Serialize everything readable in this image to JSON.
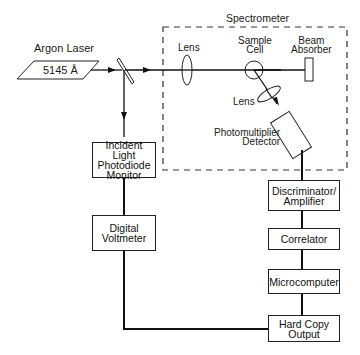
{
  "diagram": {
    "type": "block-diagram",
    "source": {
      "label": "Argon Laser",
      "wavelength": "5145 Å"
    },
    "spectrometer": {
      "label": "Spectrometer",
      "components": {
        "lens1": "Lens",
        "sample_cell": "Sample\nCell",
        "beam_absorber": "Beam\nAbsorber",
        "lens2": "Lens",
        "detector": "Photomultiplier\nDetector"
      }
    },
    "blocks": {
      "photodiode": "Incident Light\nPhotodiode\nMonitor",
      "voltmeter": "Digital\nVoltmeter",
      "discriminator": "Discriminator/\nAmplifier",
      "correlator": "Correlator",
      "microcomputer": "Microcomputer",
      "hardcopy": "Hard Copy\nOutput"
    },
    "connections": [
      [
        "Argon Laser",
        "Beam Splitter"
      ],
      [
        "Beam Splitter",
        "Lens"
      ],
      [
        "Lens",
        "Sample Cell"
      ],
      [
        "Sample Cell",
        "Beam Absorber"
      ],
      [
        "Sample Cell",
        "Lens"
      ],
      [
        "Lens",
        "Photomultiplier Detector"
      ],
      [
        "Beam Splitter",
        "Incident Light Photodiode Monitor"
      ],
      [
        "Incident Light Photodiode Monitor",
        "Digital Voltmeter"
      ],
      [
        "Digital Voltmeter",
        "Hard Copy Output"
      ],
      [
        "Photomultiplier Detector",
        "Discriminator/Amplifier"
      ],
      [
        "Discriminator/Amplifier",
        "Correlator"
      ],
      [
        "Correlator",
        "Microcomputer"
      ],
      [
        "Microcomputer",
        "Hard Copy Output"
      ]
    ]
  }
}
